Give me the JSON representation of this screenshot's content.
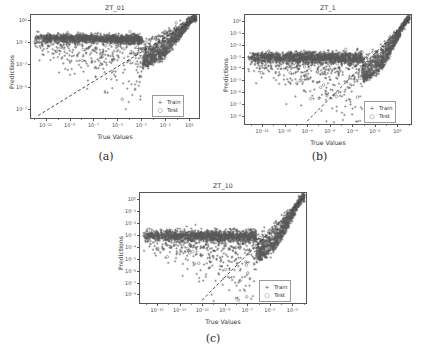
{
  "figure": {
    "background": "#ffffff",
    "marker_color": "#5a5a5a",
    "line_color": "#2b2b2b",
    "axis_color": "#555555"
  },
  "legend": {
    "train_label": "Train",
    "train_symbol": "+",
    "test_label": "Test",
    "test_symbol": "○"
  },
  "captions": {
    "a": "(a)",
    "b": "(b)",
    "c": "(c)"
  },
  "chart_data": [
    {
      "type": "scatter",
      "panel": "a",
      "title": "ZT_01",
      "xlabel": "True Values",
      "ylabel": "Predictions",
      "xscale": "log",
      "yscale": "log",
      "xlim": [
        -12.3,
        1.9
      ],
      "ylim": [
        -7.9,
        1.5
      ],
      "xticks": [
        -11,
        -9,
        -7,
        -5,
        -3,
        -1,
        1
      ],
      "xticklabels": [
        "10⁻¹¹",
        "10⁻⁹",
        "10⁻⁷",
        "10⁻⁵",
        "10⁻³",
        "10⁻¹",
        "10¹"
      ],
      "yticks": [
        1,
        -1,
        -3,
        -5,
        -7
      ],
      "yticklabels": [
        "10¹",
        "10⁻¹",
        "10⁻³",
        "10⁻⁵",
        "10⁻⁷"
      ],
      "grid": false,
      "legend_position": "lower right",
      "identity_line": {
        "from": [
          -11.7,
          -7.5
        ],
        "to": [
          1.5,
          1.2
        ],
        "style": "dashed"
      },
      "series": [
        {
          "name": "Train",
          "marker": "+",
          "n_points": 2400,
          "cloud": {
            "x_range": [
              -12.0,
              1.5
            ],
            "plateau_y": -0.55,
            "plateau_halfwidth": 0.3,
            "funnel_knee_x": -3.0,
            "converge_x": 1.3,
            "tail_spread_low": 2.9,
            "seed": 11
          }
        },
        {
          "name": "Test",
          "marker": "○",
          "n_points": 130,
          "cloud": {
            "x_range": [
              -12.0,
              1.4
            ],
            "plateau_y": -0.55,
            "plateau_halfwidth": 0.3,
            "funnel_knee_x": -3.0,
            "converge_x": 1.3,
            "tail_spread_low": 2.6,
            "seed": 77
          }
        }
      ]
    },
    {
      "type": "scatter",
      "panel": "b",
      "title": "ZT_1",
      "xlabel": "True Values",
      "ylabel": "Predictions",
      "xscale": "log",
      "yscale": "log",
      "xlim": [
        -13.6,
        1.3
      ],
      "ylim": [
        -8.8,
        0.6
      ],
      "xticks": [
        -12,
        -10,
        -8,
        -6,
        -4,
        -2,
        0
      ],
      "xticklabels": [
        "10⁻¹²",
        "10⁻¹⁰",
        "10⁻⁸",
        "10⁻⁶",
        "10⁻⁴",
        "10⁻²",
        "10⁰"
      ],
      "yticks": [
        0,
        -1,
        -2,
        -3,
        -4,
        -5,
        -6,
        -7,
        -8
      ],
      "yticklabels": [
        "10⁰",
        "10⁻¹",
        "10⁻²",
        "10⁻³",
        "10⁻⁴",
        "10⁻⁵",
        "10⁻⁶",
        "10⁻⁷",
        "10⁻⁸"
      ],
      "grid": false,
      "legend_position": "lower right",
      "identity_line": {
        "from": [
          -8.1,
          -8.4
        ],
        "to": [
          0.9,
          0.2
        ],
        "style": "dashed"
      },
      "series": [
        {
          "name": "Train",
          "marker": "+",
          "n_points": 2400,
          "cloud": {
            "x_range": [
              -13.3,
              1.0
            ],
            "plateau_y": -2.95,
            "plateau_halfwidth": 0.38,
            "funnel_knee_x": -3.2,
            "converge_x": 0.9,
            "tail_spread_low": 2.2,
            "seed": 23
          }
        },
        {
          "name": "Test",
          "marker": "○",
          "n_points": 130,
          "cloud": {
            "x_range": [
              -13.3,
              0.9
            ],
            "plateau_y": -2.95,
            "plateau_halfwidth": 0.38,
            "funnel_knee_x": -3.2,
            "converge_x": 0.9,
            "tail_spread_low": 2.0,
            "seed": 91
          }
        }
      ]
    },
    {
      "type": "scatter",
      "panel": "c",
      "title": "ZT_10",
      "xlabel": "True Values",
      "ylabel": "Predictions",
      "xscale": "log",
      "yscale": "log",
      "xlim": [
        -16.6,
        -1.7
      ],
      "ylim": [
        -8.8,
        0.6
      ],
      "xticks": [
        -15,
        -13,
        -11,
        -9,
        -7,
        -5,
        -3
      ],
      "xticklabels": [
        "10⁻¹⁵",
        "10⁻¹³",
        "10⁻¹¹",
        "10⁻⁹",
        "10⁻⁷",
        "10⁻⁵",
        "10⁻³"
      ],
      "yticks": [
        0,
        -1,
        -2,
        -3,
        -4,
        -5,
        -6,
        -7,
        -8
      ],
      "yticklabels": [
        "10⁰",
        "10⁻¹",
        "10⁻²",
        "10⁻³",
        "10⁻⁴",
        "10⁻⁵",
        "10⁻⁶",
        "10⁻⁷",
        "10⁻⁸"
      ],
      "grid": false,
      "legend_position": "lower right",
      "identity_line": {
        "from": [
          -11.1,
          -8.4
        ],
        "to": [
          -2.1,
          0.2
        ],
        "style": "dashed"
      },
      "series": [
        {
          "name": "Train",
          "marker": "+",
          "n_points": 2400,
          "cloud": {
            "x_range": [
              -16.3,
              -2.0
            ],
            "plateau_y": -2.95,
            "plateau_halfwidth": 0.38,
            "funnel_knee_x": -6.3,
            "converge_x": -2.1,
            "tail_spread_low": 2.3,
            "seed": 37
          }
        },
        {
          "name": "Test",
          "marker": "○",
          "n_points": 130,
          "cloud": {
            "x_range": [
              -16.3,
              -2.1
            ],
            "plateau_y": -2.95,
            "plateau_halfwidth": 0.38,
            "funnel_knee_x": -6.3,
            "converge_x": -2.1,
            "tail_spread_low": 2.1,
            "seed": 53
          }
        }
      ]
    }
  ]
}
